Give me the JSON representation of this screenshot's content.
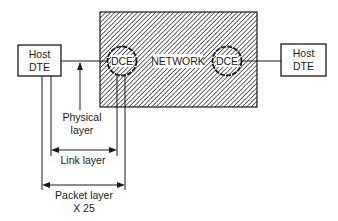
{
  "diagram": {
    "network_label": "NETWORK",
    "left_host": {
      "line1": "Host",
      "line2": "DTE"
    },
    "right_host": {
      "line1": "Host",
      "line2": "DTE"
    },
    "left_dce": "DCE",
    "right_dce": "DCE",
    "physical_layer": {
      "line1": "Physical",
      "line2": "layer"
    },
    "link_layer": "Link layer",
    "packet_layer": {
      "line1": "Packet layer",
      "line2": "X 25"
    }
  },
  "colors": {
    "ink": "#1a1a1a",
    "background": "#ffffff"
  }
}
